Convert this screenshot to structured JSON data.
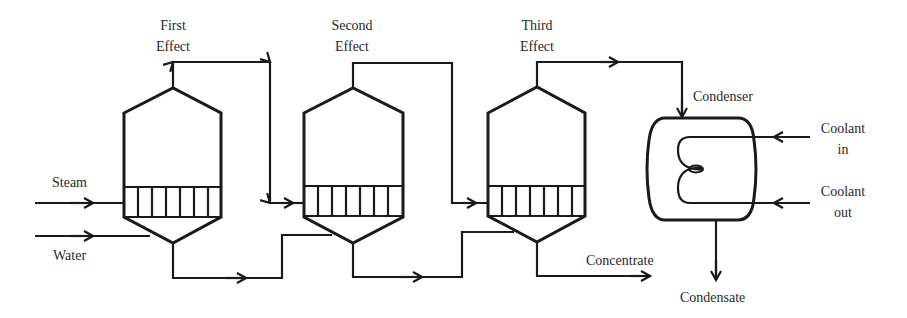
{
  "diagram": {
    "type": "process-flow",
    "effects": [
      {
        "id": "effect-1",
        "label_line1": "First",
        "label_line2": "Effect"
      },
      {
        "id": "effect-2",
        "label_line1": "Second",
        "label_line2": "Effect"
      },
      {
        "id": "effect-3",
        "label_line1": "Third",
        "label_line2": "Effect"
      }
    ],
    "inputs": {
      "steam": "Steam",
      "water": "Water"
    },
    "outputs": {
      "concentrate": "Concentrate",
      "condensate": "Condensate"
    },
    "condenser": {
      "label": "Condenser",
      "coolant_in_line1": "Coolant",
      "coolant_in_line2": "in",
      "coolant_out_line1": "Coolant",
      "coolant_out_line2": "out"
    },
    "colors": {
      "stroke": "#1a1a1a",
      "text": "#2a2a2a",
      "background": "#ffffff"
    }
  }
}
